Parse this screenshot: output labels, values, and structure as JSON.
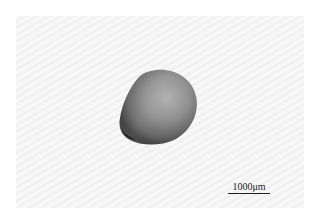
{
  "image": {
    "description": "Grayscale micrograph of a single ovoid seed on a light striped background",
    "subject": "seed",
    "scale_bar": {
      "label": "1000μm"
    },
    "colors": {
      "background": "#f4f4f4",
      "seed_dark": "#3a3a3a",
      "seed_mid": "#7a7a7a",
      "seed_light": "#a8a8a8"
    }
  }
}
